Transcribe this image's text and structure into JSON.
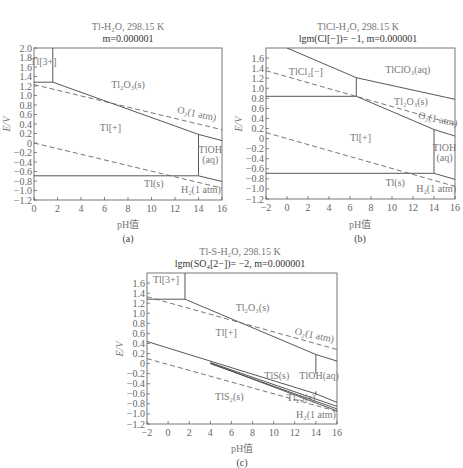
{
  "chart_data": [
    {
      "id": "a",
      "type": "line",
      "title": "Tl-H₂O, 298.15 K",
      "subtitle": "m=0.000001",
      "xlabel": "pH值",
      "ylabel": "E/V",
      "caption": "(a)",
      "xlim": [
        0,
        16
      ],
      "ylim": [
        -1.2,
        2.0
      ],
      "xticks": [
        0,
        2,
        4,
        6,
        8,
        10,
        12,
        14,
        16
      ],
      "yticks": [
        2.0,
        1.8,
        1.6,
        1.4,
        1.2,
        1.0,
        0.8,
        0.6,
        0.4,
        0.2,
        0,
        -0.2,
        -0.4,
        -0.6,
        -0.8,
        -1.0,
        -1.2
      ],
      "ytick_labels": [
        "2.0",
        "1.8",
        "1.6",
        "1.4",
        "1.2",
        "1.0",
        "0.8",
        "0.6",
        "0.4",
        "0.2",
        "0",
        "−0.2",
        "−0.4",
        "−0.6",
        "−0.8",
        "−1.0",
        "−1.2"
      ],
      "lines": [
        {
          "name": "Tl3+/Tl+ boundary",
          "style": "solid",
          "points": [
            [
              0,
              1.28
            ],
            [
              1.6,
              1.28
            ]
          ]
        },
        {
          "name": "Tl3+/Tl2O3 boundary",
          "style": "solid",
          "points": [
            [
              1.6,
              2.0
            ],
            [
              1.6,
              1.28
            ]
          ]
        },
        {
          "name": "Tl2O3/Tl+ boundary",
          "style": "solid",
          "points": [
            [
              1.6,
              1.28
            ],
            [
              14,
              0.18
            ]
          ]
        },
        {
          "name": "Tl2O3/TlOH boundary",
          "style": "solid",
          "points": [
            [
              14,
              0.18
            ],
            [
              16,
              0.05
            ]
          ]
        },
        {
          "name": "Tl+/TlOH boundary",
          "style": "solid",
          "points": [
            [
              14,
              0.18
            ],
            [
              14,
              -0.68
            ]
          ]
        },
        {
          "name": "Tl+/Tl boundary",
          "style": "solid",
          "points": [
            [
              0,
              -0.69
            ],
            [
              14,
              -0.69
            ]
          ]
        },
        {
          "name": "TlOH/Tl boundary",
          "style": "solid",
          "points": [
            [
              14,
              -0.69
            ],
            [
              16,
              -0.81
            ]
          ]
        },
        {
          "name": "O2 line",
          "style": "dashed",
          "points": [
            [
              0,
              1.23
            ],
            [
              16,
              0.28
            ]
          ]
        },
        {
          "name": "H2 line",
          "style": "dashed",
          "points": [
            [
              0,
              0.0
            ],
            [
              16,
              -0.95
            ]
          ]
        }
      ],
      "labels": [
        {
          "text": "Tl[3+]",
          "x": 0.8,
          "y": 1.65
        },
        {
          "text": "Tl₂O₃(s)",
          "x": 8.0,
          "y": 1.15
        },
        {
          "text": "O₂(1 atm)",
          "x": 13.8,
          "y": 0.55,
          "rotate": true
        },
        {
          "text": "Tl[+]",
          "x": 6.5,
          "y": 0.25
        },
        {
          "text": "TlOH",
          "x": 15.0,
          "y": -0.22
        },
        {
          "text": "(aq)",
          "x": 15.0,
          "y": -0.42
        },
        {
          "text": "Tl(s)",
          "x": 10.2,
          "y": -0.93
        },
        {
          "text": "H₂(1 atm)",
          "x": 14.2,
          "y": -1.05
        }
      ]
    },
    {
      "id": "b",
      "type": "line",
      "title": "TlCl-H₂O, 298.15 K",
      "subtitle": "lgm(Cl[−])= −1, m=0.000001",
      "xlabel": "pH值",
      "ylabel": "E/V",
      "caption": "(b)",
      "xlim": [
        -2,
        16
      ],
      "ylim": [
        -1.2,
        1.8
      ],
      "xticks": [
        -2,
        0,
        2,
        4,
        6,
        8,
        10,
        12,
        14,
        16
      ],
      "xtick_labels": [
        "−2",
        "0",
        "2",
        "4",
        "6",
        "8",
        "10",
        "12",
        "14",
        "16"
      ],
      "yticks": [
        1.6,
        1.4,
        1.2,
        1.0,
        0.8,
        0.6,
        0.4,
        0.2,
        0,
        -0.2,
        -0.4,
        -0.6,
        -0.8,
        -1.0,
        -1.2
      ],
      "ytick_labels": [
        "1.6",
        "1.4",
        "1.2",
        "1.0",
        "0.8",
        "0.6",
        "0.4",
        "0.2",
        "0",
        "−0.2",
        "−0.4",
        "−0.6",
        "−0.8",
        "−1.0",
        "−1.2"
      ],
      "lines": [
        {
          "name": "TlCl2-/TlClO3 boundary upper",
          "style": "solid",
          "points": [
            [
              0.0,
              1.8
            ],
            [
              6.6,
              1.21
            ]
          ]
        },
        {
          "name": "TlClO3/Tl2O3 boundary",
          "style": "solid",
          "points": [
            [
              6.6,
              1.21
            ],
            [
              16,
              0.78
            ]
          ]
        },
        {
          "name": "TlCl2-/Tl2O3 vertical",
          "style": "solid",
          "points": [
            [
              6.6,
              1.21
            ],
            [
              6.6,
              0.84
            ]
          ]
        },
        {
          "name": "TlCl2-/Tl+ boundary",
          "style": "solid",
          "points": [
            [
              -2,
              0.84
            ],
            [
              6.6,
              0.84
            ]
          ]
        },
        {
          "name": "Tl2O3/Tl+ boundary",
          "style": "solid",
          "points": [
            [
              6.6,
              0.84
            ],
            [
              14,
              0.18
            ]
          ]
        },
        {
          "name": "Tl2O3/TlOH boundary",
          "style": "solid",
          "points": [
            [
              14,
              0.18
            ],
            [
              16,
              0.05
            ]
          ]
        },
        {
          "name": "Tl+/TlOH boundary",
          "style": "solid",
          "points": [
            [
              14,
              0.18
            ],
            [
              14,
              -0.68
            ]
          ]
        },
        {
          "name": "Tl+/Tl boundary",
          "style": "solid",
          "points": [
            [
              -2,
              -0.69
            ],
            [
              14,
              -0.69
            ]
          ]
        },
        {
          "name": "TlOH/Tl boundary",
          "style": "solid",
          "points": [
            [
              14,
              -0.69
            ],
            [
              16,
              -0.81
            ]
          ]
        },
        {
          "name": "O2 line",
          "style": "dashed",
          "points": [
            [
              -2,
              1.35
            ],
            [
              16,
              0.28
            ]
          ]
        },
        {
          "name": "H2 line",
          "style": "dashed",
          "points": [
            [
              -2,
              0.12
            ],
            [
              16,
              -0.95
            ]
          ]
        }
      ],
      "labels": [
        {
          "text": "TlCl₂[−]",
          "x": 1.8,
          "y": 1.27
        },
        {
          "text": "TlClO₃(aq)",
          "x": 11.5,
          "y": 1.3
        },
        {
          "text": "Tl₂O₃(s)",
          "x": 11.8,
          "y": 0.66
        },
        {
          "text": "O₂(1 atm)",
          "x": 14.3,
          "y": 0.32,
          "rotate": true
        },
        {
          "text": "Tl[+]",
          "x": 7.0,
          "y": -0.05
        },
        {
          "text": "TlOH",
          "x": 15.0,
          "y": -0.25
        },
        {
          "text": "(aq)",
          "x": 15.0,
          "y": -0.45
        },
        {
          "text": "Tl(s)",
          "x": 10.3,
          "y": -0.95
        },
        {
          "text": "H₂(1 atm)",
          "x": 14.2,
          "y": -1.07
        }
      ]
    },
    {
      "id": "c",
      "type": "line",
      "title": "Tl-S-H₂O, 298.15 K",
      "subtitle": "lgm(SO₄[2−])= −2, m=0.000001",
      "xlabel": "pH值",
      "ylabel": "E/V",
      "caption": "(c)",
      "xlim": [
        -2,
        16
      ],
      "ylim": [
        -1.2,
        1.8
      ],
      "xticks": [
        -2,
        0,
        2,
        4,
        6,
        8,
        10,
        12,
        14,
        16
      ],
      "xtick_labels": [
        "−2",
        "0",
        "2",
        "4",
        "6",
        "8",
        "10",
        "12",
        "14",
        "16"
      ],
      "yticks": [
        1.6,
        1.4,
        1.2,
        1.0,
        0.8,
        0.6,
        0.4,
        0.2,
        0,
        -0.2,
        -0.4,
        -0.6,
        -0.8,
        -1.0,
        -1.2
      ],
      "ytick_labels": [
        "1.6",
        "1.4",
        "1.2",
        "1.0",
        "0.8",
        "0.6",
        "0.4",
        "0.2",
        "0",
        "−0.2",
        "−0.4",
        "−0.6",
        "−0.8",
        "−1.0",
        "−1.2"
      ],
      "lines": [
        {
          "name": "Tl3+/Tl+ boundary",
          "style": "solid",
          "points": [
            [
              -2,
              1.28
            ],
            [
              1.6,
              1.28
            ]
          ]
        },
        {
          "name": "Tl3+/Tl2O3 boundary",
          "style": "solid",
          "points": [
            [
              1.6,
              1.8
            ],
            [
              1.6,
              1.28
            ]
          ]
        },
        {
          "name": "Tl2O3/Tl+ boundary",
          "style": "solid",
          "points": [
            [
              1.6,
              1.28
            ],
            [
              14,
              0.18
            ]
          ]
        },
        {
          "name": "Tl2O3/TlOH boundary",
          "style": "solid",
          "points": [
            [
              14,
              0.18
            ],
            [
              16,
              0.05
            ]
          ]
        },
        {
          "name": "Tl+/TlOH boundary",
          "style": "solid",
          "points": [
            [
              14,
              0.18
            ],
            [
              14,
              -0.2
            ]
          ]
        },
        {
          "name": "Tl+/TlS boundary",
          "style": "solid",
          "points": [
            [
              -2,
              0.44
            ],
            [
              14,
              -0.6
            ]
          ]
        },
        {
          "name": "TlOH/TlS boundary",
          "style": "solid",
          "points": [
            [
              14,
              -0.6
            ],
            [
              16,
              -0.77
            ]
          ]
        },
        {
          "name": "TlS/Tl2S boundary",
          "style": "solid",
          "points": [
            [
              4,
              0.02
            ],
            [
              16,
              -0.85
            ]
          ]
        },
        {
          "name": "Tl2S lower boundary",
          "style": "solid",
          "points": [
            [
              4,
              0.0
            ],
            [
              16,
              -0.9
            ]
          ]
        },
        {
          "name": "Tl2S/TlS2 boundary",
          "style": "solid",
          "points": [
            [
              4,
              0.01
            ],
            [
              16,
              -0.94
            ]
          ]
        },
        {
          "name": "TlS/TlOH vertical",
          "style": "solid",
          "points": [
            [
              14,
              -0.55
            ],
            [
              14,
              -0.63
            ]
          ]
        },
        {
          "name": "O2 line",
          "style": "dashed",
          "points": [
            [
              -2,
              1.33
            ],
            [
              16,
              0.28
            ]
          ]
        },
        {
          "name": "H2 line",
          "style": "dashed",
          "points": [
            [
              -2,
              0.1
            ],
            [
              16,
              -0.95
            ]
          ]
        }
      ],
      "labels": [
        {
          "text": "Tl[3+]",
          "x": -0.2,
          "y": 1.6
        },
        {
          "text": "Tl₂O₃(s)",
          "x": 8.0,
          "y": 1.05
        },
        {
          "text": "O₂(1 atm)",
          "x": 13.8,
          "y": 0.5,
          "rotate": true
        },
        {
          "text": "Tl[+]",
          "x": 5.5,
          "y": 0.55
        },
        {
          "text": "TlS(s)",
          "x": 10.3,
          "y": -0.3
        },
        {
          "text": "TlOH(aq)",
          "x": 14.3,
          "y": -0.3
        },
        {
          "text": "TlS₂(s)",
          "x": 5.8,
          "y": -0.73
        },
        {
          "text": "Tl₂S(s)",
          "x": 12.6,
          "y": -0.75
        },
        {
          "text": "H₂(1 atm)",
          "x": 14.0,
          "y": -1.08
        }
      ]
    }
  ]
}
